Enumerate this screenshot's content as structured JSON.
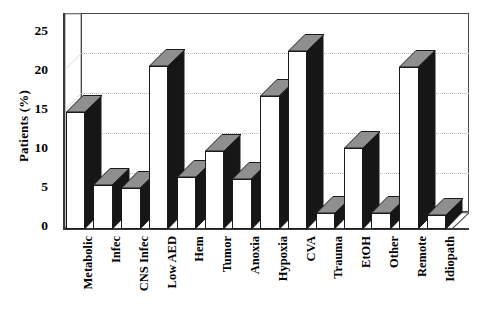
{
  "chart_data": {
    "type": "bar",
    "title": "",
    "xlabel": "",
    "ylabel": "Patients (%)",
    "ylim": [
      0,
      25
    ],
    "yticks": [
      "0",
      "5",
      "10",
      "15",
      "20",
      "25"
    ],
    "ytick_values": [
      0,
      5,
      10,
      15,
      20,
      25
    ],
    "grid": true,
    "legend": "none",
    "style": "3d-bar",
    "categories": [
      "Metabolic",
      "Infec",
      "CNS Infec",
      "Low AED",
      "Hem",
      "Tumor",
      "Anoxia",
      "Hypoxia",
      "CVA",
      "Trauma",
      "EtOH",
      "Other",
      "Remote",
      "Idiopath"
    ],
    "values": [
      14.7,
      5.5,
      5.1,
      20.5,
      6.5,
      9.8,
      6.3,
      16.7,
      22.4,
      2.0,
      10.2,
      2.0,
      20.3,
      1.8
    ],
    "bar_colors": {
      "front": "#ffffff",
      "side": "#161616",
      "top": "#8f8f8f",
      "outline": "#1a1a1a"
    },
    "grid_color": "#b9b9b9",
    "axis_color": "#3a3a3a"
  },
  "axis": {
    "y_title": "Patients (%)"
  }
}
